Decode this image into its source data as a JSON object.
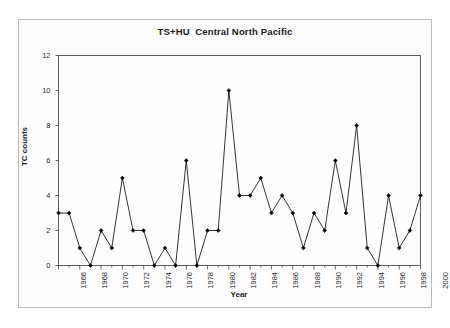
{
  "chart_data": {
    "type": "line",
    "title": "TS+HU  Central North Pacific",
    "xlabel": "Year",
    "ylabel": "TC counts",
    "grid": false,
    "legend": false,
    "marker": "filled-diamond",
    "line_color": "#000000",
    "marker_color": "#000000",
    "xlim": [
      1966,
      2000
    ],
    "ylim": [
      0,
      12
    ],
    "ytick_labels": [
      "0",
      "2",
      "4",
      "6",
      "8",
      "10",
      "12"
    ],
    "yticks": [
      0,
      2,
      4,
      6,
      8,
      10,
      12
    ],
    "xtick_labels": [
      "1966",
      "1968",
      "1970",
      "1972",
      "1974",
      "1976",
      "1978",
      "1980",
      "1982",
      "1984",
      "1986",
      "1988",
      "1990",
      "1992",
      "1994",
      "1996",
      "1998",
      "2000"
    ],
    "xticks": [
      1966,
      1968,
      1970,
      1972,
      1974,
      1976,
      1978,
      1980,
      1982,
      1984,
      1986,
      1988,
      1990,
      1992,
      1994,
      1996,
      1998,
      2000
    ],
    "x": [
      1966,
      1967,
      1968,
      1969,
      1970,
      1971,
      1972,
      1973,
      1974,
      1975,
      1976,
      1977,
      1978,
      1979,
      1980,
      1981,
      1982,
      1983,
      1984,
      1985,
      1986,
      1987,
      1988,
      1989,
      1990,
      1991,
      1992,
      1993,
      1994,
      1995,
      1996,
      1997,
      1998,
      1999,
      2000
    ],
    "values": [
      3,
      3,
      1,
      0,
      2,
      1,
      5,
      2,
      2,
      0,
      1,
      0,
      6,
      0,
      2,
      2,
      10,
      4,
      4,
      5,
      3,
      4,
      3,
      1,
      3,
      2,
      6,
      3,
      8,
      1,
      0,
      4,
      1,
      2,
      4
    ]
  }
}
